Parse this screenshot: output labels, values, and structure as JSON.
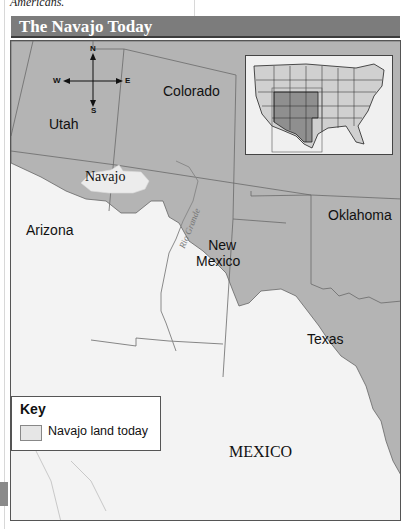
{
  "page": {
    "cutoff_text": "Americans."
  },
  "map": {
    "title": "The Navajo Today",
    "colors": {
      "title_bar": "#7c7c7c",
      "us_states": "#b4b4b4",
      "mexico_land": "#f3f3f3",
      "navajo_land": "#e6e6e6",
      "border_lines": "#666666",
      "river": "#8a8a8a"
    },
    "compass": {
      "n": "N",
      "s": "S",
      "e": "E",
      "w": "W"
    },
    "labels": {
      "utah": "Utah",
      "colorado": "Colorado",
      "navajo": "Navajo",
      "arizona": "Arizona",
      "new_mexico_line1": "New",
      "new_mexico_line2": "Mexico",
      "oklahoma": "Oklahoma",
      "texas": "Texas",
      "mexico": "MEXICO",
      "rio_grande": "Rio Grande"
    },
    "inset": {
      "description": "Locator map of the contiguous United States with Southwest region highlighted"
    },
    "key": {
      "title": "Key",
      "items": [
        {
          "label": "Navajo land today",
          "swatch_color": "#e6e6e6"
        }
      ]
    }
  }
}
